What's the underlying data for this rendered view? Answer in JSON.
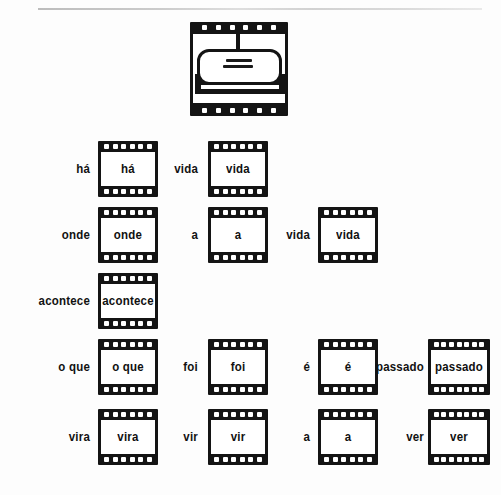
{
  "document": {
    "title": "Palavras em fotogramas",
    "language": "pt-BR",
    "rule_color": "#cccccc",
    "ink_color": "#141414",
    "paper_color": "#fdfdfd"
  },
  "header": {
    "illustration_name": "film-frame-speech-bubble",
    "caption": ""
  },
  "rows": [
    {
      "id": "row-1",
      "cells": [
        {
          "label": "há",
          "frame": "há"
        },
        {
          "label": "vida",
          "frame": "vida"
        }
      ]
    },
    {
      "id": "row-2",
      "cells": [
        {
          "label": "onde",
          "frame": "onde"
        },
        {
          "label": "a",
          "frame": "a"
        },
        {
          "label": "vida",
          "frame": "vida"
        }
      ]
    },
    {
      "id": "row-3",
      "cells": [
        {
          "label": "acontece",
          "frame": "acontece"
        }
      ]
    },
    {
      "id": "row-4",
      "cells": [
        {
          "label": "o que",
          "frame": "o que"
        },
        {
          "label": "foi",
          "frame": "foi"
        },
        {
          "label": "é",
          "frame": "é"
        },
        {
          "label": "passado",
          "frame": "passado"
        }
      ]
    },
    {
      "id": "row-5",
      "cells": [
        {
          "label": "vira",
          "frame": "vira"
        },
        {
          "label": "vir",
          "frame": "vir"
        },
        {
          "label": "a",
          "frame": "a"
        },
        {
          "label": "ver",
          "frame": "ver"
        }
      ]
    }
  ],
  "layout": {
    "row_tops": [
      141,
      207,
      273,
      339,
      409
    ],
    "columns": [
      {
        "label_right": 90,
        "frame_left": 98,
        "frame_width": 60
      },
      {
        "label_right": 198,
        "frame_left": 208,
        "frame_width": 60
      },
      {
        "label_right": 310,
        "frame_left": 318,
        "frame_width": 60
      },
      {
        "label_right": 424,
        "frame_left": 428,
        "frame_width": 62
      }
    ]
  }
}
